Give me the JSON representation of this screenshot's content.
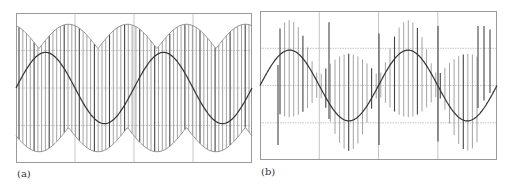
{
  "figure": {
    "panels": [
      {
        "label": "(a)"
      },
      {
        "label": "(b)"
      }
    ]
  },
  "colors": {
    "frame": "#9a9a9a",
    "grid": "#b8b8b8",
    "pulse": "#8c8c8c",
    "pulse_dark": "#444444",
    "sine": "#333333"
  },
  "chart_data": [
    {
      "type": "line",
      "title": "",
      "panel_label": "(a)",
      "xlabel": "",
      "ylabel": "",
      "grid": true,
      "grid_divisions": {
        "x": 4,
        "y": 4
      },
      "xlim": [
        0,
        4
      ],
      "ylim": [
        -2,
        2
      ],
      "series": [
        {
          "name": "reference sine",
          "x_range": [
            0,
            4
          ],
          "cycles": 2.0,
          "amplitude": 0.95,
          "offset": 0.0,
          "phase_deg": 0
        },
        {
          "name": "PWM pulse train envelope",
          "kind": "pulses",
          "pulse_count": 62,
          "envelope_upper_max": 1.7,
          "envelope_upper_min": 1.05,
          "envelope_lower_max": -1.05,
          "envelope_lower_min": -1.7
        }
      ]
    },
    {
      "type": "line",
      "title": "",
      "panel_label": "(b)",
      "xlabel": "",
      "ylabel": "",
      "grid": true,
      "grid_divisions": {
        "x": 4,
        "y": 4
      },
      "xlim": [
        0,
        4
      ],
      "ylim": [
        -2,
        2
      ],
      "series": [
        {
          "name": "reference sine",
          "x_range": [
            0,
            4
          ],
          "cycles": 2.0,
          "amplitude": 0.95,
          "offset": 0.0,
          "phase_deg": 0
        },
        {
          "name": "PWM pulse train (overmodulated)",
          "kind": "pulses",
          "pulse_count": 44,
          "envelope_upper_max": 1.75,
          "envelope_lower_min": -1.75
        }
      ]
    }
  ]
}
